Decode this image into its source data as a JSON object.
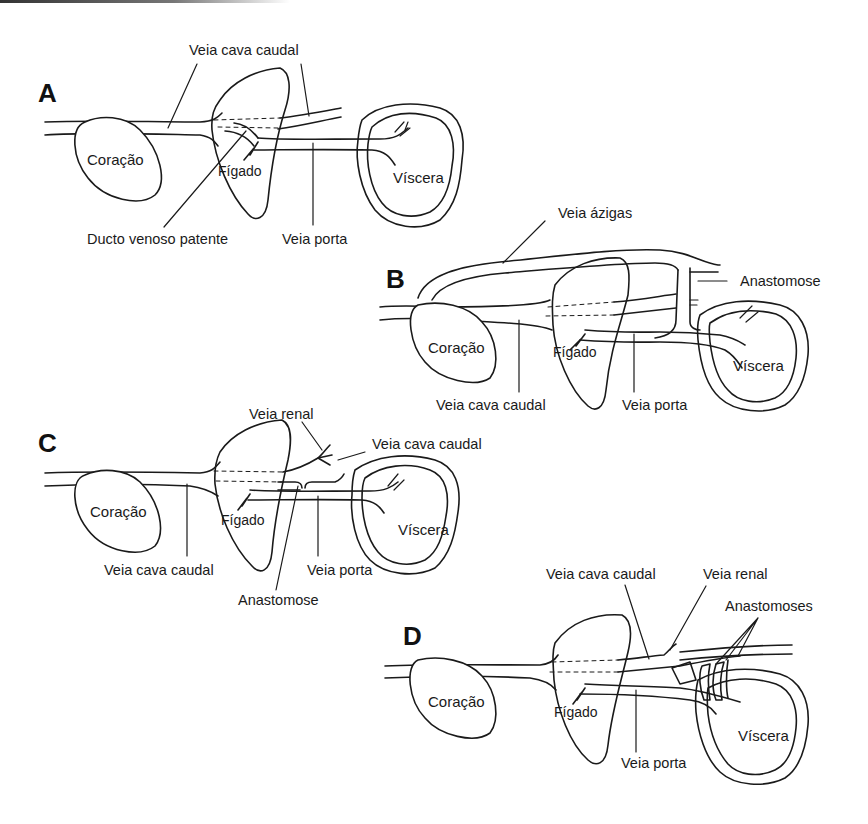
{
  "panels": {
    "A": {
      "letter": "A",
      "labels": {
        "vena_cava": "Veia cava caudal",
        "ductus": "Ducto venoso patente",
        "portal": "Veia porta",
        "heart": "Coração",
        "liver": "Fígado",
        "viscera": "Víscera"
      }
    },
    "B": {
      "letter": "B",
      "labels": {
        "azygos": "Veia ázigas",
        "anastomosis": "Anastomose",
        "vena_cava": "Veia cava caudal",
        "portal": "Veia porta",
        "heart": "Coração",
        "liver": "Fígado",
        "viscera": "Víscera"
      }
    },
    "C": {
      "letter": "C",
      "labels": {
        "renal": "Veia renal",
        "vena_cava_upper": "Veia cava caudal",
        "vena_cava_lower": "Veia cava caudal",
        "portal": "Veia porta",
        "anastomosis": "Anastomose",
        "heart": "Coração",
        "liver": "Fígado",
        "viscera": "Víscera"
      }
    },
    "D": {
      "letter": "D",
      "labels": {
        "vena_cava": "Veia cava caudal",
        "renal": "Veia renal",
        "anastomoses": "Anastomoses",
        "portal": "Veia porta",
        "heart": "Coração",
        "liver": "Fígado",
        "viscera": "Víscera"
      }
    }
  },
  "colors": {
    "ink": "#1a1a1a",
    "background": "#ffffff"
  }
}
